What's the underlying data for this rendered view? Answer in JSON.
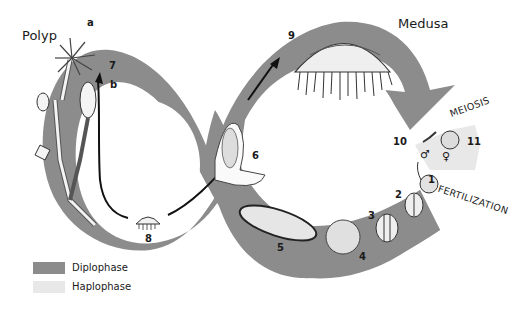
{
  "diagram": {
    "type": "life-cycle",
    "colors": {
      "diplophase": "#8c8c8c",
      "haplophase": "#e8e8e8",
      "ink": "#1a1a1a"
    },
    "labels": {
      "polyp": "Polyp",
      "medusa": "Medusa",
      "meiosis": "MEIOSIS",
      "fertilization": "FERTILIZATION",
      "a": "a",
      "b": "b"
    },
    "stages": [
      {
        "num": "1",
        "desc": "zygote (fertilized egg)"
      },
      {
        "num": "2",
        "desc": "2-cell stage"
      },
      {
        "num": "3",
        "desc": "4-cell stage"
      },
      {
        "num": "4",
        "desc": "blastula"
      },
      {
        "num": "5",
        "desc": "planula larva"
      },
      {
        "num": "6",
        "desc": "settled planula"
      },
      {
        "num": "7",
        "desc": "polyp colony"
      },
      {
        "num": "8",
        "desc": "young medusa"
      },
      {
        "num": "9",
        "desc": "medusa"
      },
      {
        "num": "10",
        "desc": "sperm"
      },
      {
        "num": "11",
        "desc": "egg"
      }
    ],
    "symbols": {
      "male": "♂",
      "female": "♀"
    },
    "legend": [
      {
        "label": "Diplophase",
        "color": "#8c8c8c"
      },
      {
        "label": "Haplophase",
        "color": "#e8e8e8"
      }
    ]
  }
}
